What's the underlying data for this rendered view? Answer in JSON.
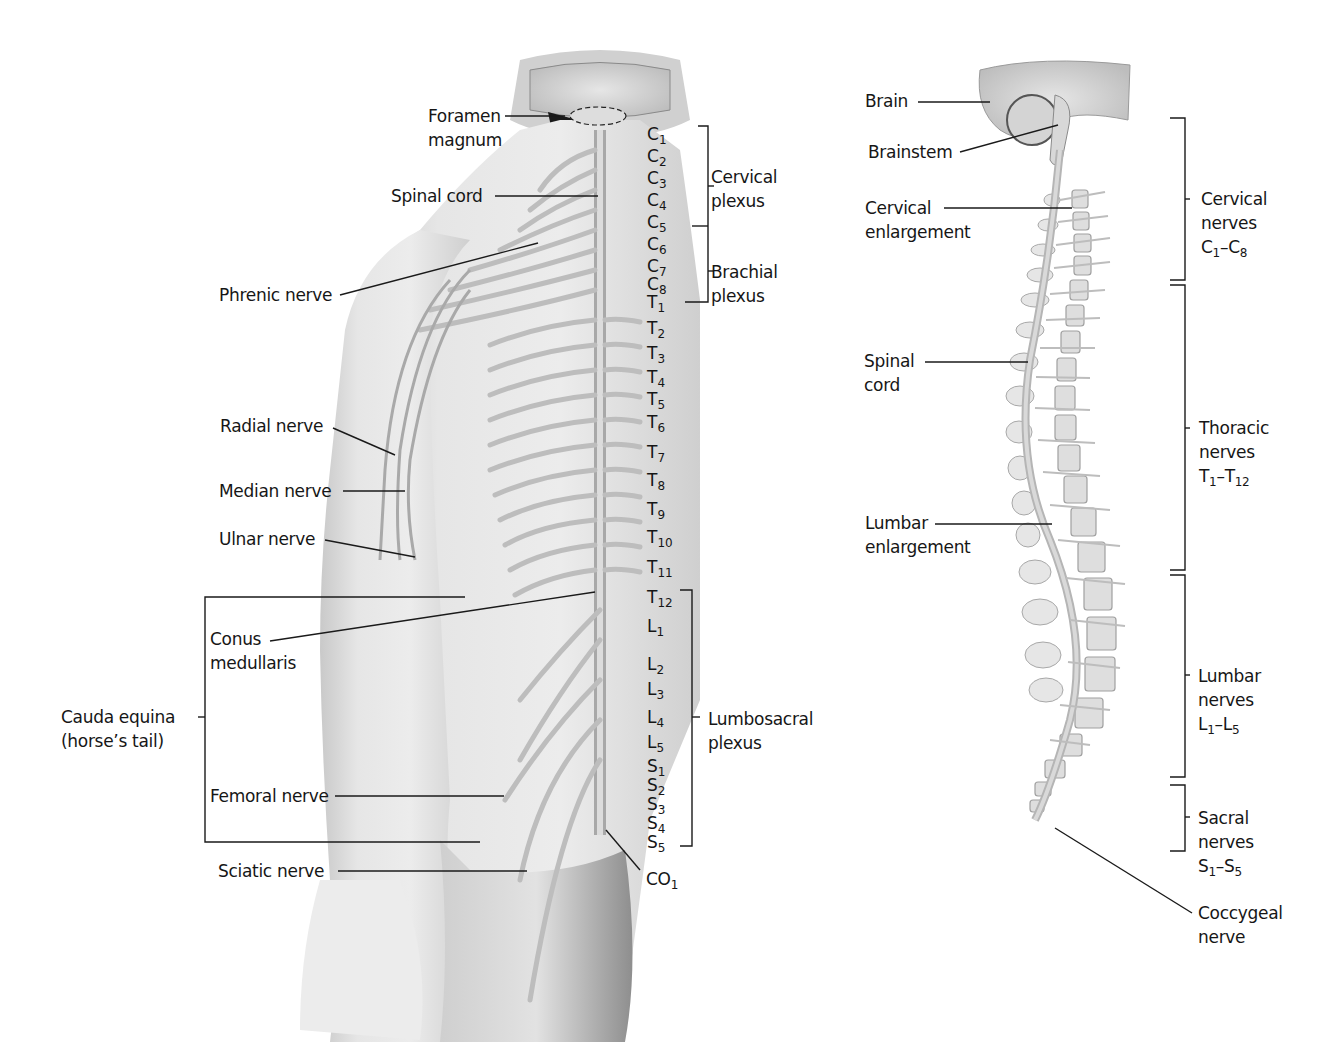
{
  "figure": {
    "background": "#ffffff",
    "ink_color": "#161616",
    "body_tone": "#d9d9d9",
    "nerve_tone": "#b8b8b8"
  },
  "posterior_view": {
    "labels": {
      "foramen_magnum": [
        "Foramen",
        "magnum"
      ],
      "spinal_cord": "Spinal cord",
      "phrenic_nerve": "Phrenic nerve",
      "radial_nerve": "Radial nerve",
      "median_nerve": "Median nerve",
      "ulnar_nerve": "Ulnar nerve",
      "conus_medullaris": [
        "Conus",
        "medullaris"
      ],
      "cauda_equina": [
        "Cauda equina",
        "(horse’s tail)"
      ],
      "femoral_nerve": "Femoral nerve",
      "sciatic_nerve": "Sciatic nerve",
      "coccygeal": {
        "letter": "CO",
        "sub": "1"
      }
    },
    "plexuses": {
      "cervical": [
        "Cervical",
        "plexus"
      ],
      "brachial": [
        "Brachial",
        "plexus"
      ],
      "lumbosacral": [
        "Lumbosacral",
        "plexus"
      ]
    },
    "segments": [
      {
        "letter": "C",
        "sub": "1"
      },
      {
        "letter": "C",
        "sub": "2"
      },
      {
        "letter": "C",
        "sub": "3"
      },
      {
        "letter": "C",
        "sub": "4"
      },
      {
        "letter": "C",
        "sub": "5"
      },
      {
        "letter": "C",
        "sub": "6"
      },
      {
        "letter": "C",
        "sub": "7"
      },
      {
        "letter": "C",
        "sub": "8"
      },
      {
        "letter": "T",
        "sub": "1"
      },
      {
        "letter": "T",
        "sub": "2"
      },
      {
        "letter": "T",
        "sub": "3"
      },
      {
        "letter": "T",
        "sub": "4"
      },
      {
        "letter": "T",
        "sub": "5"
      },
      {
        "letter": "T",
        "sub": "6"
      },
      {
        "letter": "T",
        "sub": "7"
      },
      {
        "letter": "T",
        "sub": "8"
      },
      {
        "letter": "T",
        "sub": "9"
      },
      {
        "letter": "T",
        "sub": "10"
      },
      {
        "letter": "T",
        "sub": "11"
      },
      {
        "letter": "T",
        "sub": "12"
      },
      {
        "letter": "L",
        "sub": "1"
      },
      {
        "letter": "L",
        "sub": "2"
      },
      {
        "letter": "L",
        "sub": "3"
      },
      {
        "letter": "L",
        "sub": "4"
      },
      {
        "letter": "L",
        "sub": "5"
      },
      {
        "letter": "S",
        "sub": "1"
      },
      {
        "letter": "S",
        "sub": "2"
      },
      {
        "letter": "S",
        "sub": "3"
      },
      {
        "letter": "S",
        "sub": "4"
      },
      {
        "letter": "S",
        "sub": "5"
      }
    ]
  },
  "lateral_view": {
    "labels": {
      "brain": "Brain",
      "brainstem": "Brainstem",
      "cervical_enlargement": [
        "Cervical",
        "enlargement"
      ],
      "spinal_cord": [
        "Spinal",
        "cord"
      ],
      "lumbar_enlargement": [
        "Lumbar",
        "enlargement"
      ],
      "coccygeal_nerve": [
        "Coccygeal",
        "nerve"
      ]
    },
    "nerve_groups": [
      {
        "name": "Cervical",
        "word": "nerves",
        "from": {
          "letter": "C",
          "sub": "1"
        },
        "to": {
          "letter": "C",
          "sub": "8"
        }
      },
      {
        "name": "Thoracic",
        "word": "nerves",
        "from": {
          "letter": "T",
          "sub": "1"
        },
        "to": {
          "letter": "T",
          "sub": "12"
        }
      },
      {
        "name": "Lumbar",
        "word": "nerves",
        "from": {
          "letter": "L",
          "sub": "1"
        },
        "to": {
          "letter": "L",
          "sub": "5"
        }
      },
      {
        "name": "Sacral",
        "word": "nerves",
        "from": {
          "letter": "S",
          "sub": "1"
        },
        "to": {
          "letter": "S",
          "sub": "5"
        }
      }
    ]
  }
}
